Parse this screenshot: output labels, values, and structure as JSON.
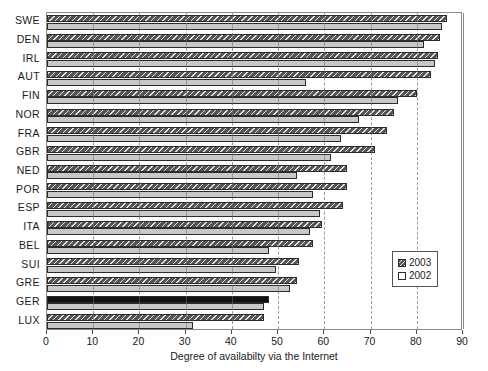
{
  "chart_data": {
    "type": "bar",
    "orientation": "horizontal",
    "title": "",
    "subtitle": "",
    "xlabel": "Degree of availabilty via the Internet",
    "ylabel": "",
    "xlim": [
      0,
      90
    ],
    "ylim": null,
    "xticks": [
      0,
      10,
      20,
      30,
      40,
      50,
      60,
      70,
      80,
      90
    ],
    "xtick_labels": [
      "0",
      "10",
      "20",
      "30",
      "40",
      "50",
      "60",
      "70",
      "80",
      "90"
    ],
    "grid": "vertical-dashed",
    "legend_position": "center-right-inside",
    "categories": [
      "SWE",
      "DEN",
      "IRL",
      "AUT",
      "FIN",
      "NOR",
      "FRA",
      "GBR",
      "NED",
      "POR",
      "ESP",
      "ITA",
      "BEL",
      "SUI",
      "GRE",
      "GER",
      "LUX"
    ],
    "series": [
      {
        "name": "2003",
        "color": "#555555",
        "pattern": "diagonal-hatch",
        "values": [
          86.5,
          85.0,
          84.5,
          83.0,
          80.0,
          75.0,
          73.5,
          71.0,
          65.0,
          65.0,
          64.0,
          59.5,
          57.5,
          54.5,
          54.0,
          48.0,
          47.0
        ]
      },
      {
        "name": "2002",
        "color": "#c8c8c8",
        "pattern": "solid",
        "values": [
          85.5,
          81.5,
          84.0,
          56.0,
          76.0,
          67.5,
          63.5,
          61.5,
          54.0,
          57.5,
          59.0,
          57.0,
          48.0,
          49.5,
          52.5,
          47.0,
          31.5
        ]
      }
    ],
    "highlight": {
      "category": "GER",
      "series": "2003",
      "color": "#111111",
      "note": "bar rendered solid black instead of hatched"
    },
    "annotations": []
  },
  "legend": {
    "entries": [
      {
        "label": "2003",
        "swatch": "hatched-dark-swatch"
      },
      {
        "label": "2002",
        "swatch": "light-swatch"
      }
    ]
  },
  "axes": {
    "x_title": "Degree of availabilty via the Internet"
  }
}
